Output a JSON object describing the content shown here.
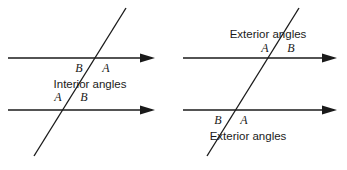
{
  "figure": {
    "type": "geometry-diagram",
    "stroke_color": "#1a1a1a",
    "background_color": "#ffffff",
    "width": 347,
    "height": 170
  },
  "left_diagram": {
    "name": "interior-angles-figure",
    "caption": "Interior angles",
    "top_intersection": {
      "left_label": "B",
      "right_label": "A"
    },
    "bottom_intersection": {
      "left_label": "A",
      "right_label": "B"
    },
    "lines": {
      "upper_parallel": {
        "x1": 8,
        "y1": 58,
        "x2": 158,
        "y2": 58,
        "arrow": "right"
      },
      "lower_parallel": {
        "x1": 8,
        "y1": 110,
        "x2": 158,
        "y2": 110,
        "arrow": "right"
      },
      "transversal": {
        "x1": 34,
        "y1": 156,
        "x2": 126,
        "y2": 8
      }
    }
  },
  "right_diagram": {
    "name": "exterior-angles-figure",
    "caption_top": "Exterior angles",
    "caption_bottom": "Exterior angles",
    "top_intersection": {
      "left_label": "A",
      "right_label": "B"
    },
    "bottom_intersection": {
      "left_label": "B",
      "right_label": "A"
    },
    "lines": {
      "upper_parallel": {
        "x1": 183,
        "y1": 58,
        "x2": 340,
        "y2": 58,
        "arrow": "right"
      },
      "lower_parallel": {
        "x1": 183,
        "y1": 110,
        "x2": 340,
        "y2": 110,
        "arrow": "right"
      },
      "transversal": {
        "x1": 207,
        "y1": 156,
        "x2": 299,
        "y2": 8
      }
    }
  }
}
